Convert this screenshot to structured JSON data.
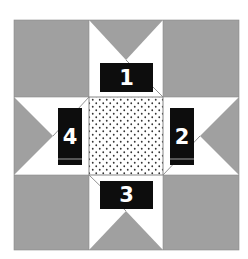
{
  "diagram": {
    "type": "quilt-block",
    "name": "star block",
    "colors": {
      "background": "#a0a0a0",
      "star_points": "#ffffff",
      "center": "#ffffff",
      "center_dots": "#333333",
      "label_bg": "#0d0d0d",
      "label_text": "#ffffff",
      "outline": "#888888"
    },
    "labels": [
      {
        "id": "1",
        "text": "1",
        "position": "top"
      },
      {
        "id": "2",
        "text": "2",
        "position": "right"
      },
      {
        "id": "3",
        "text": "3",
        "position": "bottom"
      },
      {
        "id": "4",
        "text": "4",
        "position": "left"
      }
    ]
  }
}
